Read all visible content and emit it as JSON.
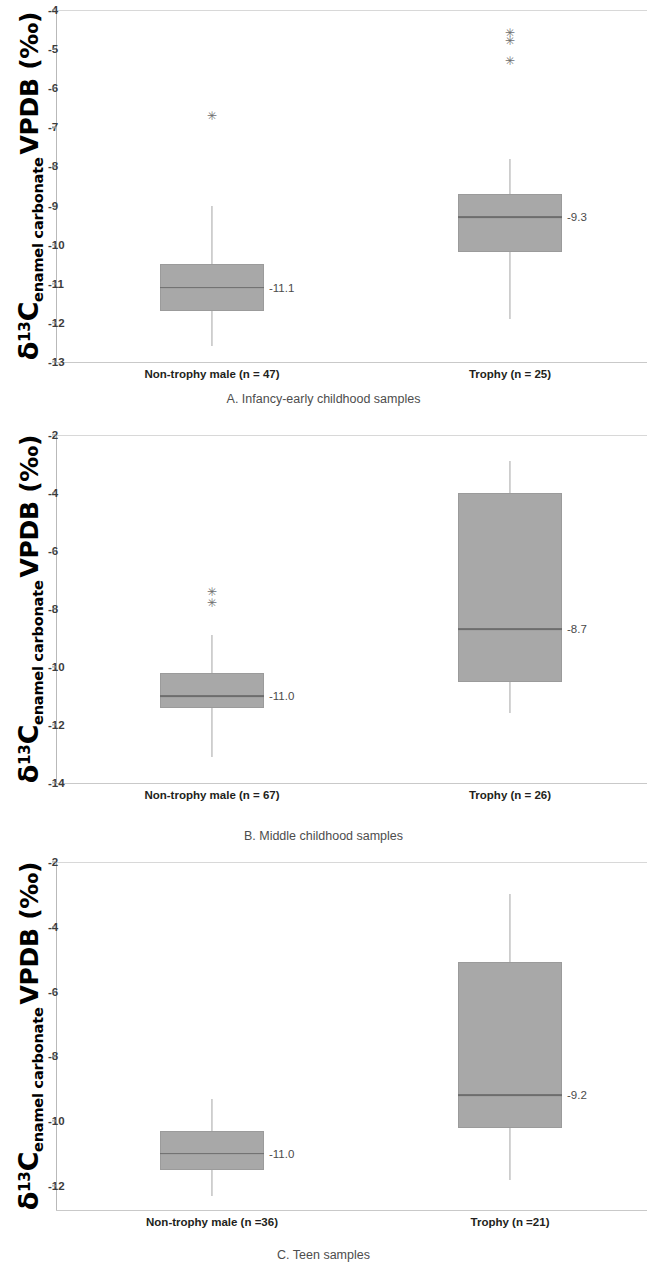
{
  "figure": {
    "y_axis_title": {
      "delta": "δ",
      "superscript": "13",
      "element": "C",
      "subscript": "enamel carbonate",
      "tail": "VPDB (‰)"
    }
  },
  "chart_data": [
    {
      "type": "box",
      "panel_id": "A",
      "title": "A. Infancy-early childhood samples",
      "xlabel": "",
      "ylabel": "δ13Cenamel carbonate VPDB (‰)",
      "ylim": [
        -13,
        -4
      ],
      "yticks": [
        -4,
        -5,
        -6,
        -7,
        -8,
        -9,
        -10,
        -11,
        -12,
        -13
      ],
      "ytick_labels": [
        "-4",
        "-5",
        "-6",
        "-7",
        "-8",
        "-9",
        "-10",
        "-11",
        "-12",
        "-13"
      ],
      "grid": false,
      "legend": "none",
      "categories": [
        "Non-trophy male (n = 47)",
        "Trophy (n = 25)"
      ],
      "boxes": [
        {
          "category": "Non-trophy male (n = 47)",
          "whisker_high": -9.0,
          "q3": -10.5,
          "median": -11.1,
          "q1": -11.7,
          "whisker_low": -12.6,
          "median_label": "-11.1",
          "outliers": [
            -6.7
          ]
        },
        {
          "category": "Trophy (n = 25)",
          "whisker_high": -7.8,
          "q3": -8.7,
          "median": -9.3,
          "q1": -10.2,
          "whisker_low": -11.9,
          "median_label": "-9.3",
          "outliers": [
            -4.6,
            -4.8,
            -5.3
          ]
        }
      ]
    },
    {
      "type": "box",
      "panel_id": "B",
      "title": "B. Middle childhood samples",
      "xlabel": "",
      "ylabel": "δ13Cenamel carbonate VPDB (‰)",
      "ylim": [
        -14,
        -2
      ],
      "yticks": [
        -2,
        -4,
        -6,
        -8,
        -10,
        -12,
        -14
      ],
      "ytick_labels": [
        "-2",
        "-4",
        "-6",
        "-8",
        "-10",
        "-12",
        "-14"
      ],
      "grid": false,
      "legend": "none",
      "categories": [
        "Non-trophy male (n = 67)",
        "Trophy (n = 26)"
      ],
      "boxes": [
        {
          "category": "Non-trophy male (n = 67)",
          "whisker_high": -8.9,
          "q3": -10.2,
          "median": -11.0,
          "q1": -11.4,
          "whisker_low": -13.1,
          "median_label": "-11.0",
          "outliers": [
            -7.4,
            -7.8
          ]
        },
        {
          "category": "Trophy (n = 26)",
          "whisker_high": -2.9,
          "q3": -4.0,
          "median": -8.7,
          "q1": -10.5,
          "whisker_low": -11.6,
          "median_label": "-8.7",
          "outliers": []
        }
      ]
    },
    {
      "type": "box",
      "panel_id": "C",
      "title": "C. Teen samples",
      "xlabel": "",
      "ylabel": "δ13Cenamel carbonate VPDB (‰)",
      "ylim": [
        -12.8,
        -2
      ],
      "yticks": [
        -2,
        -4,
        -6,
        -8,
        -10,
        -12
      ],
      "ytick_labels": [
        "-2",
        "-4",
        "-6",
        "-8",
        "-10",
        "-12"
      ],
      "grid": false,
      "legend": "none",
      "categories": [
        "Non-trophy male (n =36)",
        "Trophy (n =21)"
      ],
      "boxes": [
        {
          "category": "Non-trophy male (n =36)",
          "whisker_high": -9.3,
          "q3": -10.3,
          "median": -11.0,
          "q1": -11.5,
          "whisker_low": -12.3,
          "median_label": "-11.0",
          "outliers": []
        },
        {
          "category": "Trophy (n =21)",
          "whisker_high": -3.0,
          "q3": -5.1,
          "median": -9.2,
          "q1": -10.2,
          "whisker_low": -11.8,
          "median_label": "-9.2",
          "outliers": []
        }
      ]
    }
  ]
}
